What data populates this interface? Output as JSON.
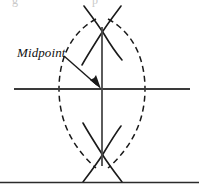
{
  "figure": {
    "caption_fragment": "g",
    "caption_fragment_2": "p",
    "labels": {
      "midpoint": "Midpoint"
    },
    "colors": {
      "stroke": "#1a1a1a",
      "line": "#3a3a3a",
      "background": "#ffffff",
      "divider": "#2b2b2b",
      "ghost_text": "#c9c9c9"
    },
    "geometry": {
      "canvas_width": 199,
      "canvas_height": 191,
      "center_x": 102,
      "center_y": 89,
      "horizontal_line": {
        "x1": 14,
        "y1": 89,
        "x2": 190,
        "y2": 89
      },
      "vertical_line": {
        "x1": 102,
        "y1": 27,
        "x2": 102,
        "y2": 166
      },
      "top_crossing": {
        "x": 102,
        "y": 29
      },
      "bottom_crossing": {
        "x": 102,
        "y": 158
      },
      "left_arc_center": {
        "x": 50,
        "y": 93
      },
      "right_arc_center": {
        "x": 153,
        "y": 93
      },
      "arc_radius": 72,
      "arrow_start": {
        "x": 64,
        "y": 56
      },
      "arrow_end": {
        "x": 100,
        "y": 87
      },
      "divider_y": 182,
      "dash_pattern": "6 4"
    }
  }
}
